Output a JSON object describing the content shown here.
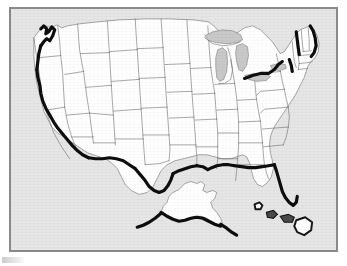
{
  "document": {
    "type": "map",
    "title": "United States Outline Map",
    "caption": "",
    "medium": "scanned printed black-and-white map"
  },
  "frame": {
    "border_color": "#8a8a8a",
    "page_background": "#ffffff",
    "ocean_background": "#e6e6e6"
  },
  "map_style": {
    "land_fill": "#ffffff",
    "state_border_color": "#6e6e6e",
    "state_border_width": 0.6,
    "emphasis_outline_color": "#0d0d0d",
    "emphasis_outline_width": 3.2,
    "lake_fill": "#c9c9c9",
    "projection_note": "Albers-like conic, lower 48 with Alaska and Hawaii insets placed in Gulf of Mexico"
  },
  "regions": {
    "contiguous_label": "Contiguous United States",
    "alaska_label": "Alaska",
    "hawaii_label": "Hawaii",
    "great_lakes_label": "Great Lakes"
  },
  "states": [
    {
      "code": "WA",
      "name": "Washington"
    },
    {
      "code": "OR",
      "name": "Oregon"
    },
    {
      "code": "CA",
      "name": "California"
    },
    {
      "code": "NV",
      "name": "Nevada"
    },
    {
      "code": "ID",
      "name": "Idaho"
    },
    {
      "code": "MT",
      "name": "Montana"
    },
    {
      "code": "WY",
      "name": "Wyoming"
    },
    {
      "code": "UT",
      "name": "Utah"
    },
    {
      "code": "AZ",
      "name": "Arizona"
    },
    {
      "code": "CO",
      "name": "Colorado"
    },
    {
      "code": "NM",
      "name": "New Mexico"
    },
    {
      "code": "ND",
      "name": "North Dakota"
    },
    {
      "code": "SD",
      "name": "South Dakota"
    },
    {
      "code": "NE",
      "name": "Nebraska"
    },
    {
      "code": "KS",
      "name": "Kansas"
    },
    {
      "code": "OK",
      "name": "Oklahoma"
    },
    {
      "code": "TX",
      "name": "Texas"
    },
    {
      "code": "MN",
      "name": "Minnesota"
    },
    {
      "code": "IA",
      "name": "Iowa"
    },
    {
      "code": "MO",
      "name": "Missouri"
    },
    {
      "code": "AR",
      "name": "Arkansas"
    },
    {
      "code": "LA",
      "name": "Louisiana"
    },
    {
      "code": "WI",
      "name": "Wisconsin"
    },
    {
      "code": "IL",
      "name": "Illinois"
    },
    {
      "code": "MI",
      "name": "Michigan"
    },
    {
      "code": "IN",
      "name": "Indiana"
    },
    {
      "code": "OH",
      "name": "Ohio"
    },
    {
      "code": "KY",
      "name": "Kentucky"
    },
    {
      "code": "TN",
      "name": "Tennessee"
    },
    {
      "code": "MS",
      "name": "Mississippi"
    },
    {
      "code": "AL",
      "name": "Alabama"
    },
    {
      "code": "GA",
      "name": "Georgia"
    },
    {
      "code": "FL",
      "name": "Florida"
    },
    {
      "code": "SC",
      "name": "South Carolina"
    },
    {
      "code": "NC",
      "name": "North Carolina"
    },
    {
      "code": "VA",
      "name": "Virginia"
    },
    {
      "code": "WV",
      "name": "West Virginia"
    },
    {
      "code": "MD",
      "name": "Maryland"
    },
    {
      "code": "DE",
      "name": "Delaware"
    },
    {
      "code": "PA",
      "name": "Pennsylvania"
    },
    {
      "code": "NJ",
      "name": "New Jersey"
    },
    {
      "code": "NY",
      "name": "New York"
    },
    {
      "code": "CT",
      "name": "Connecticut"
    },
    {
      "code": "RI",
      "name": "Rhode Island"
    },
    {
      "code": "MA",
      "name": "Massachusetts"
    },
    {
      "code": "VT",
      "name": "Vermont"
    },
    {
      "code": "NH",
      "name": "New Hampshire"
    },
    {
      "code": "ME",
      "name": "Maine"
    },
    {
      "code": "AK",
      "name": "Alaska"
    },
    {
      "code": "HI",
      "name": "Hawaii"
    }
  ],
  "emphasized_edges": [
    "Pacific coast of California",
    "Oregon and Washington coast",
    "US-Mexico border along Arizona and New Mexico",
    "Rio Grande border of Texas",
    "Gulf of Mexico coast",
    "West coast of Florida",
    "Lake Champlain / Vermont-New York border",
    "Lake Erie shoreline of Ohio and Pennsylvania",
    "Maine coast",
    "Alaska southern coast and Aleutian chain",
    "Hawaiian island outlines"
  ]
}
